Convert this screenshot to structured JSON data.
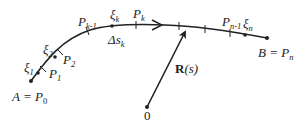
{
  "diagram": {
    "type": "parametrized-curve-partition",
    "colors": {
      "stroke": "#222222",
      "background": "#ffffff"
    },
    "labels": {
      "start": {
        "main": "A = P",
        "sub": "0"
      },
      "end": {
        "main": "B = P",
        "sub": "n"
      },
      "xi_1": {
        "main": "ξ",
        "sub": "1"
      },
      "p_1": {
        "main": "P",
        "sub": "1"
      },
      "xi_2": {
        "main": "ξ",
        "sub": "2"
      },
      "p_2": {
        "main": "P",
        "sub": "2"
      },
      "p_k_minus_1": {
        "main": "P",
        "sub": "k-1"
      },
      "xi_k": {
        "main": "ξ",
        "sub": "k"
      },
      "p_k": {
        "main": "P",
        "sub": "k"
      },
      "delta_s_k": {
        "main": "Δs",
        "sub": "k"
      },
      "p_n_minus_1": {
        "main": "P",
        "sub": "n-1"
      },
      "xi_n": {
        "main": "ξ",
        "sub": "n"
      },
      "vector": {
        "bold": "R",
        "rest": "(s)"
      },
      "origin": "0"
    }
  }
}
